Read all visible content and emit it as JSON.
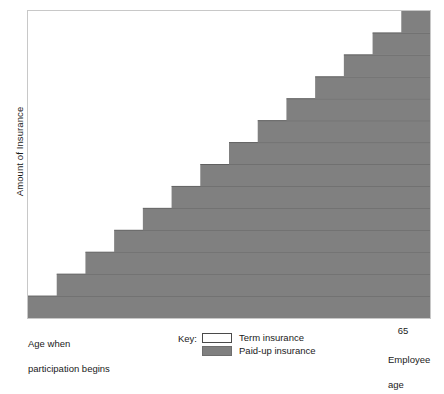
{
  "chart_data": {
    "type": "area",
    "title": "",
    "xlabel": "Employee age",
    "ylabel": "Amount of Insurance",
    "x_start_label": "Age when\nparticipation begins",
    "x_end_label": "65",
    "grid": false,
    "legend_position": "bottom-center",
    "series": [
      {
        "name": "Paid-up insurance",
        "color": "#808080",
        "description": "Grey staircase rising from lower-left to upper-right; each step is one year-band of accumulated paid-up insurance.",
        "values": [
          1,
          2,
          3,
          4,
          5,
          6,
          7,
          8,
          9,
          10,
          11,
          12,
          13,
          14
        ]
      },
      {
        "name": "Term insurance",
        "color": "#ffffff",
        "description": "White region above the staircase; the shrinking remainder of total coverage that is still term insurance.",
        "values": [
          13,
          12,
          11,
          10,
          9,
          8,
          7,
          6,
          5,
          4,
          3,
          2,
          1,
          0
        ]
      }
    ],
    "steps": 14,
    "step_count_note": "Total amount of insurance stays constant; paid-up portion grows one band per period until age 65.",
    "ylim": [
      0,
      14
    ],
    "xlim": [
      0,
      14
    ]
  },
  "axis": {
    "y_title": "Amount of Insurance",
    "x_start_line1": "Age when",
    "x_start_line2": "participation begins",
    "x_end_value": "65",
    "x_end_line1": "Employee",
    "x_end_line2": "age"
  },
  "legend": {
    "title": "Key:",
    "items": [
      {
        "label": "Term insurance",
        "color": "#ffffff"
      },
      {
        "label": "Paid-up insurance",
        "color": "#808080"
      }
    ]
  },
  "colors": {
    "paid_up": "#808080",
    "term": "#ffffff",
    "plot_border": "#c8c8c8",
    "step_divider": "#5f5f5f",
    "text": "#1a1a1a"
  }
}
